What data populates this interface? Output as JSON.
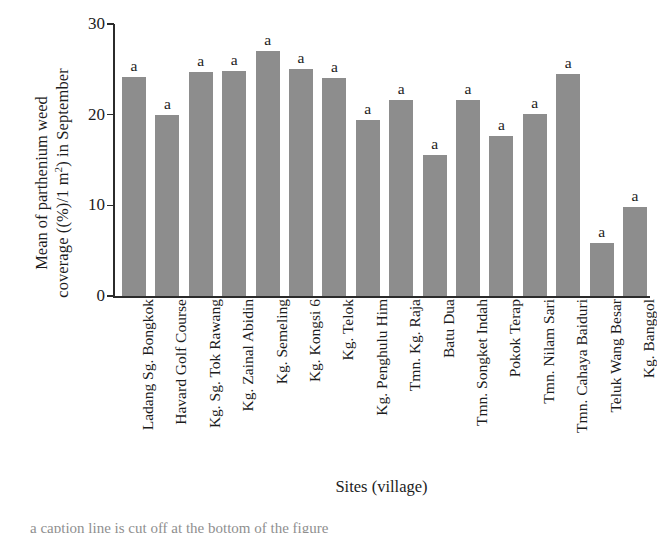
{
  "chart_data": {
    "type": "bar",
    "title": "",
    "xlabel": "Sites (village)",
    "ylabel_line1": "Mean of parthenium weed",
    "ylabel_line2_pre": "coverage ((%)/1 m",
    "ylabel_line2_sup": "2",
    "ylabel_line2_post": ") in September",
    "ylabel_full": "Mean of parthenium weed coverage ((%)/1 m2) in September",
    "ylim": [
      0,
      30
    ],
    "yticks": [
      0,
      10,
      20,
      30
    ],
    "ytick_labels": [
      "0",
      "10",
      "20",
      "30"
    ],
    "grid": false,
    "legend": "none",
    "bar_color": "#8d8d8d",
    "axis_color": "#2b2b2b",
    "categories": [
      "Ladang Sg. Bongkok",
      "Havard Golf Course",
      "Kg. Sg. Tok Rawang",
      "Kg. Zainal Abidin",
      "Kg. Semeling",
      "Kg. Kongsi 6",
      "Kg. Telok",
      "Kg. Penghulu Him",
      "Tmn. Kg. Raja",
      "Batu Dua",
      "Tmn. Songket Indah",
      "Pokok Terap",
      "Tmn. Nilam Sari",
      "Tmn. Cahaya Baiduri",
      "Teluk Wang Besar",
      "Kg. Banggol"
    ],
    "values": [
      24.2,
      20.0,
      24.7,
      24.8,
      27.0,
      25.0,
      24.0,
      19.4,
      21.6,
      15.5,
      21.6,
      17.6,
      20.1,
      24.5,
      5.8,
      9.8
    ],
    "annotations": [
      "a",
      "a",
      "a",
      "a",
      "a",
      "a",
      "a",
      "a",
      "a",
      "a",
      "a",
      "a",
      "a",
      "a",
      "a",
      "a"
    ]
  },
  "caption": "a caption line is cut off at the bottom of the figure"
}
